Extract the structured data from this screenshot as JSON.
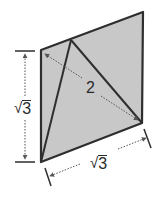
{
  "diagram": {
    "shape": "rhombus-with-inscribed-triangle",
    "fill_color": "#c8c8c8",
    "stroke_color": "#2e2e2e",
    "dim_color": "#555555",
    "labels": {
      "diagonal": "2",
      "left_side_sym": "√",
      "left_side_num": "3",
      "bottom_side_sym": "√",
      "bottom_side_num": "3"
    },
    "vertices": {
      "top_left": [
        41,
        50
      ],
      "top_right": [
        143,
        12
      ],
      "bottom_right": [
        142,
        123
      ],
      "bottom_left": [
        41,
        162
      ],
      "triangle_apex": [
        71,
        40
      ]
    }
  }
}
